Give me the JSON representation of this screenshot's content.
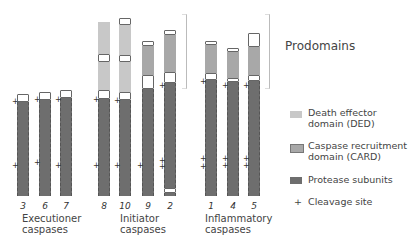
{
  "title": "Prodomains",
  "groups": [
    {
      "label": "Executioner caspases",
      "line1": "Executioner",
      "line2": "caspases"
    },
    {
      "label": "Initiator caspases",
      "line1": "Initiator",
      "line2": "caspases"
    },
    {
      "label": "Inflammatory caspases",
      "line1": "Inflammatory",
      "line2": "caspases"
    }
  ],
  "caspases": [
    "3",
    "6",
    "7",
    "8",
    "10",
    "9",
    "2",
    "1",
    "4",
    "5"
  ],
  "legend": {
    "ded": {
      "line1": "Death effector",
      "line2": "domain (DED)",
      "color": "#c8c8c8"
    },
    "card": {
      "line1": "Caspase recruitment",
      "line2": "domain (CARD)",
      "color": "#a8a8a8"
    },
    "protease": {
      "line1": "Protease subunits",
      "color": "#6e6e6e"
    },
    "cleavage": {
      "symbol": "+",
      "line1": "Cleavage site"
    }
  }
}
